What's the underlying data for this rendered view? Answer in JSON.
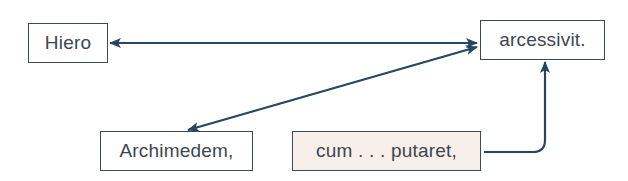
{
  "diagram": {
    "nodes": [
      {
        "id": "hiero",
        "label": "Hiero"
      },
      {
        "id": "arcessivit",
        "label": "arcessivit."
      },
      {
        "id": "archimedem",
        "label": "Archimedem,"
      },
      {
        "id": "cum_putaret",
        "label": "cum . . . putaret,"
      }
    ],
    "edges": [
      {
        "from": "hiero",
        "to": "arcessivit",
        "type": "bidirectional"
      },
      {
        "from": "arcessivit",
        "to": "archimedem",
        "type": "bidirectional"
      },
      {
        "from": "cum_putaret",
        "to": "arcessivit",
        "type": "directed"
      }
    ],
    "colors": {
      "line": "#254560",
      "box_border": "#3a4a5a",
      "highlight_fill": "#f8efea"
    }
  }
}
